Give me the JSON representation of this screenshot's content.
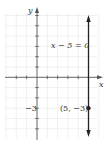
{
  "diagram": {
    "type": "coordinate-graph",
    "x_axis_label": "x",
    "y_axis_label": "y",
    "equation_label": "x − 5 = 0",
    "point_label": "(5, −3)",
    "y_tick_label": "−3",
    "point": {
      "x": 5,
      "y": -3
    },
    "vertical_line_x": 5,
    "x_range": [
      -3,
      5
    ],
    "y_range": [
      -6,
      6
    ],
    "colors": {
      "grid": "#e4e4e4",
      "axes": "#555555",
      "line": "#222222",
      "text": "#333333"
    }
  }
}
